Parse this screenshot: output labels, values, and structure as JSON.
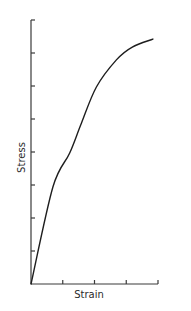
{
  "chart_data": {
    "type": "line",
    "title": "",
    "xlabel": "Strain",
    "ylabel": "Stress",
    "x_ticks": 4,
    "y_ticks": 8,
    "xlim": [
      0,
      4
    ],
    "ylim": [
      0,
      8
    ],
    "grid": false,
    "legend": null,
    "series": [
      {
        "name": "Stress-strain curve",
        "x": [
          0,
          0.69,
          1.22,
          1.59,
          2.06,
          2.69,
          3.19,
          3.84
        ],
        "y": [
          0,
          2.94,
          3.97,
          4.88,
          5.97,
          6.79,
          7.18,
          7.42
        ]
      }
    ]
  },
  "colors": {
    "line": "#1e1e1e",
    "axis": "#3a3a3a",
    "text": "#2a2a2a",
    "background": "#ffffff"
  }
}
